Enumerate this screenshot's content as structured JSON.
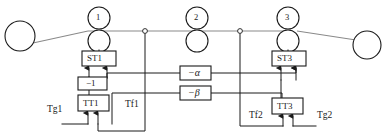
{
  "diagram": {
    "stroke_color": "#2b2b2b",
    "web_color": "#808080",
    "background": "#ffffff"
  },
  "rollers": [
    {
      "id": "unwind-roll",
      "label": "",
      "cx": 20,
      "cy": 36,
      "r": 15
    },
    {
      "id": "nip-1",
      "label": "1",
      "cx": 99,
      "cy": 18,
      "r": 11
    },
    {
      "id": "nip-2",
      "label": "2",
      "cx": 197,
      "cy": 18,
      "r": 11
    },
    {
      "id": "nip-3",
      "label": "3",
      "cx": 288,
      "cy": 18,
      "r": 11
    },
    {
      "id": "rewind-roll",
      "label": "",
      "cx": 367,
      "cy": 45,
      "r": 14
    }
  ],
  "driven_rollers": [
    {
      "id": "nip-1-lower",
      "cx": 99,
      "cy": 41,
      "r": 11
    },
    {
      "id": "nip-2-lower",
      "cx": 197,
      "cy": 41,
      "r": 11
    },
    {
      "id": "nip-3-lower",
      "cx": 288,
      "cy": 41,
      "r": 11
    }
  ],
  "sensors": [
    {
      "id": "tension-sensor-1",
      "cx": 145,
      "cy": 31,
      "r": 2.4
    },
    {
      "id": "tension-sensor-2",
      "cx": 240,
      "cy": 31,
      "r": 2.4
    }
  ],
  "blocks": [
    {
      "id": "st1",
      "label": "ST1",
      "x": 82,
      "y": 51,
      "w": 34,
      "h": 15
    },
    {
      "id": "gain1",
      "label": "−1",
      "x": 78,
      "y": 77,
      "w": 29,
      "h": 13
    },
    {
      "id": "tt1",
      "label": "TT1",
      "x": 78,
      "y": 95,
      "w": 31,
      "h": 16
    },
    {
      "id": "alpha",
      "label": "−α",
      "x": 180,
      "y": 66,
      "w": 31,
      "h": 14
    },
    {
      "id": "beta",
      "label": "−β",
      "x": 180,
      "y": 86,
      "w": 31,
      "h": 14
    },
    {
      "id": "st3",
      "label": "ST3",
      "x": 272,
      "y": 51,
      "w": 34,
      "h": 15
    },
    {
      "id": "tt3",
      "label": "TT3",
      "x": 272,
      "y": 98,
      "w": 31,
      "h": 16
    }
  ],
  "free_labels": [
    {
      "id": "tg1",
      "text": "Tg1",
      "x": 47,
      "y": 105
    },
    {
      "id": "tf1",
      "text": "Tf1",
      "x": 125,
      "y": 100
    },
    {
      "id": "tf2",
      "text": "Tf2",
      "x": 249,
      "y": 111
    },
    {
      "id": "tg2",
      "text": "Tg2",
      "x": 317,
      "y": 111
    }
  ],
  "signals": {
    "web_path": "unwind roll -> nip 1 -> sensor 1 -> nip 2 -> sensor 2 -> nip 3 -> rewind roll",
    "feedback": [
      "Tf1",
      "Tf2"
    ],
    "setpoints": [
      "Tg1",
      "Tg2"
    ],
    "cross_gains": [
      "−α",
      "−β",
      "−1"
    ]
  }
}
